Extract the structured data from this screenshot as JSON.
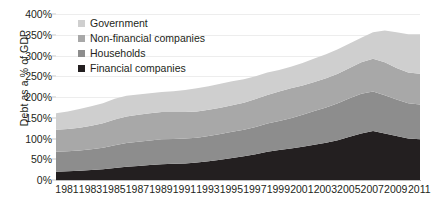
{
  "chart_data": {
    "type": "area",
    "title": "",
    "subtitle": "",
    "xlabel": "",
    "ylabel": "Debt as a % of GDP",
    "stacked": true,
    "grid": true,
    "legend_position": "top-left",
    "xlim": [
      1981,
      2012
    ],
    "ylim": [
      0,
      400
    ],
    "ytick_values": [
      0,
      50,
      100,
      150,
      200,
      250,
      300,
      350,
      400
    ],
    "ytick_labels": [
      "0%",
      "50%",
      "100%",
      "150%",
      "200%",
      "250%",
      "300%",
      "350%",
      "400%"
    ],
    "x": [
      1981,
      1982,
      1983,
      1984,
      1985,
      1986,
      1987,
      1988,
      1989,
      1990,
      1991,
      1992,
      1993,
      1994,
      1995,
      1996,
      1997,
      1998,
      1999,
      2000,
      2001,
      2002,
      2003,
      2004,
      2005,
      2006,
      2007,
      2008,
      2009,
      2010,
      2011,
      2012
    ],
    "xtick_values": [
      1981,
      1983,
      1985,
      1987,
      1989,
      1991,
      1993,
      1995,
      1997,
      1999,
      2001,
      2003,
      2005,
      2007,
      2009,
      2011
    ],
    "xtick_labels": [
      "1981",
      "1983",
      "1985",
      "1987",
      "1989",
      "1991",
      "1993",
      "1995",
      "1997",
      "1999",
      "2001",
      "2003",
      "2005",
      "2007",
      "2009",
      "2011"
    ],
    "series": [
      {
        "name": "Financial companies",
        "color": "#231f20",
        "values": [
          20,
          21,
          22,
          24,
          26,
          29,
          32,
          34,
          36,
          38,
          39,
          40,
          42,
          45,
          49,
          53,
          57,
          62,
          68,
          72,
          76,
          80,
          85,
          90,
          96,
          104,
          112,
          118,
          112,
          106,
          100,
          98
        ]
      },
      {
        "name": "Households",
        "color": "#8d8d8d",
        "values": [
          48,
          48,
          49,
          50,
          52,
          55,
          57,
          58,
          59,
          60,
          60,
          60,
          60,
          61,
          62,
          63,
          64,
          66,
          68,
          70,
          73,
          77,
          81,
          85,
          89,
          93,
          96,
          95,
          92,
          88,
          85,
          84
        ]
      },
      {
        "name": "Non-financial companies",
        "color": "#a8a8a8",
        "values": [
          53,
          54,
          55,
          57,
          59,
          62,
          64,
          65,
          66,
          66,
          65,
          64,
          63,
          63,
          63,
          64,
          65,
          67,
          69,
          71,
          72,
          71,
          70,
          70,
          71,
          73,
          76,
          79,
          80,
          76,
          74,
          74
        ]
      },
      {
        "name": "Government",
        "color": "#cfcfcf",
        "values": [
          40,
          42,
          45,
          47,
          48,
          50,
          50,
          49,
          48,
          48,
          50,
          53,
          56,
          57,
          58,
          58,
          57,
          55,
          54,
          52,
          52,
          54,
          57,
          58,
          59,
          59,
          59,
          64,
          76,
          86,
          92,
          95
        ]
      }
    ],
    "series_order_bottom_to_top": [
      "Financial companies",
      "Households",
      "Non-financial companies",
      "Government"
    ],
    "legend_order_top_to_bottom": [
      "Government",
      "Non-financial companies",
      "Households",
      "Financial companies"
    ]
  }
}
